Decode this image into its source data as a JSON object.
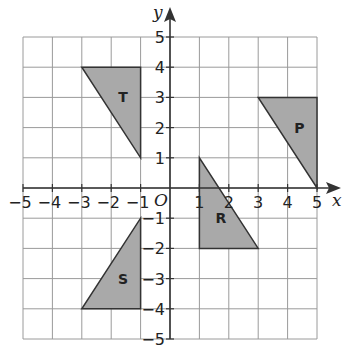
{
  "diagram": {
    "type": "coordinate-grid",
    "x_axis_label": "x",
    "y_axis_label": "y",
    "origin_label": "O",
    "x_range": [
      -5,
      5
    ],
    "y_range": [
      -5,
      5
    ],
    "x_ticks": [
      "-5",
      "-4",
      "-3",
      "-2",
      "-1",
      "1",
      "2",
      "3",
      "4",
      "5"
    ],
    "y_ticks": [
      "5",
      "4",
      "3",
      "2",
      "1",
      "-1",
      "-2",
      "-3",
      "-4",
      "-5"
    ],
    "colors": {
      "grid": "#9a9a9a",
      "axis": "#333333",
      "shape_fill": "#a9a9a9",
      "shape_stroke": "#333333"
    },
    "shapes": [
      {
        "label": "T",
        "vertices": [
          [
            -3,
            4
          ],
          [
            -1,
            4
          ],
          [
            -1,
            1
          ]
        ]
      },
      {
        "label": "P",
        "vertices": [
          [
            3,
            3
          ],
          [
            5,
            3
          ],
          [
            5,
            0
          ]
        ]
      },
      {
        "label": "S",
        "vertices": [
          [
            -1,
            -1
          ],
          [
            -1,
            -4
          ],
          [
            -3,
            -4
          ]
        ]
      },
      {
        "label": "R",
        "vertices": [
          [
            1,
            1
          ],
          [
            1,
            -2
          ],
          [
            3,
            -2
          ]
        ]
      }
    ]
  }
}
